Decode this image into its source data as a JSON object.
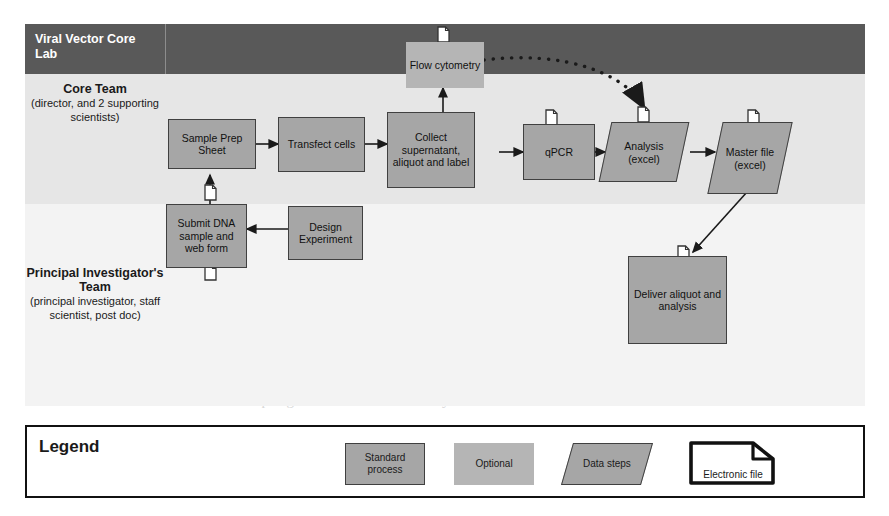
{
  "header": {
    "title": "Viral Vector Core Lab",
    "bar_color": "#595959"
  },
  "lanes": [
    {
      "id": "core",
      "title": "Core Team",
      "subtitle": "(director, and 2 supporting scientists)",
      "background": "#e6e6e6"
    },
    {
      "id": "pi",
      "title": "Principal Investigator's Team",
      "subtitle": "(principal investigator, staff scientist, post doc)",
      "background": "#f3f3f3"
    }
  ],
  "nodes": [
    {
      "id": "sample-prep-sheet",
      "label": "Sample Prep Sheet",
      "type": "standard-process",
      "lane": "core",
      "has_file_icon": true
    },
    {
      "id": "transfect-cells",
      "label": "Transfect cells",
      "type": "standard-process",
      "lane": "core",
      "has_file_icon": false
    },
    {
      "id": "collect-supernatant",
      "label": "Collect supernatant, aliquot and label",
      "type": "standard-process",
      "lane": "core",
      "has_file_icon": false
    },
    {
      "id": "flow-cytometry",
      "label": "Flow cytometry",
      "type": "optional",
      "lane": "core",
      "has_file_icon": true
    },
    {
      "id": "qpcr",
      "label": "qPCR",
      "type": "standard-process",
      "lane": "core",
      "has_file_icon": true
    },
    {
      "id": "analysis-excel",
      "label": "Analysis (excel)",
      "type": "data-steps",
      "lane": "core",
      "has_file_icon": true
    },
    {
      "id": "master-file-excel",
      "label": "Master file (excel)",
      "type": "data-steps",
      "lane": "core",
      "has_file_icon": true
    },
    {
      "id": "submit-dna-sample",
      "label": "Submit DNA sample and web form",
      "type": "standard-process",
      "lane": "pi",
      "has_file_icon": true
    },
    {
      "id": "design-experiment",
      "label": "Design Experiment",
      "type": "standard-process",
      "lane": "pi",
      "has_file_icon": false
    },
    {
      "id": "deliver-aliquot",
      "label": "Deliver aliquot and analysis",
      "type": "standard-process",
      "lane": "pi",
      "has_file_icon": true
    }
  ],
  "connectors": [
    {
      "from": "design-experiment",
      "to": "submit-dna-sample",
      "style": "solid"
    },
    {
      "from": "submit-dna-sample",
      "to": "sample-prep-sheet",
      "style": "solid"
    },
    {
      "from": "sample-prep-sheet",
      "to": "transfect-cells",
      "style": "solid"
    },
    {
      "from": "transfect-cells",
      "to": "collect-supernatant",
      "style": "solid"
    },
    {
      "from": "collect-supernatant",
      "to": "flow-cytometry",
      "style": "solid"
    },
    {
      "from": "collect-supernatant",
      "to": "qpcr",
      "style": "solid"
    },
    {
      "from": "qpcr",
      "to": "analysis-excel",
      "style": "solid"
    },
    {
      "from": "flow-cytometry",
      "to": "analysis-excel",
      "style": "dotted"
    },
    {
      "from": "analysis-excel",
      "to": "master-file-excel",
      "style": "solid"
    },
    {
      "from": "master-file-excel",
      "to": "deliver-aliquot",
      "style": "solid"
    }
  ],
  "legend": {
    "title": "Legend",
    "items": [
      {
        "id": "standard-process",
        "label": "Standard process",
        "shape": "rectangle",
        "fill": "#a6a6a6",
        "stroke": "#404040"
      },
      {
        "id": "optional",
        "label": "Optional",
        "shape": "rectangle",
        "fill": "#b5b5b5",
        "stroke": "none"
      },
      {
        "id": "data-steps",
        "label": "Data steps",
        "shape": "parallelogram",
        "fill": "#a6a6a6",
        "stroke": "#404040"
      },
      {
        "id": "electronic-file",
        "label": "Electronic file",
        "shape": "document",
        "fill": "#ffffff",
        "stroke": "#111111"
      }
    ]
  },
  "page_ghost_text": [
    "the tract nts been extend with",
    "tracking and quantitation",
    "the multiple devices to work",
    "tracked in",
    "shipping is a standard interface",
    "following status, process is finished",
    "the adopting the VVC consultant says the modules"
  ]
}
